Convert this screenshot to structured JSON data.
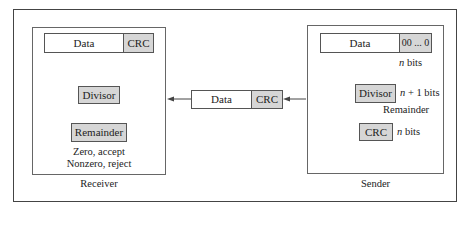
{
  "receiver": {
    "label": "Receiver",
    "codeword": {
      "data": "Data",
      "crc": "CRC"
    },
    "divisor": "Divisor",
    "remainder": "Remainder",
    "result_lines": [
      "Zero, accept",
      "Nonzero, reject"
    ]
  },
  "channel": {
    "data": "Data",
    "crc": "CRC",
    "direction": "sender-to-receiver"
  },
  "sender": {
    "label": "Sender",
    "dataword": {
      "data": "Data",
      "padding": "00 ... 0"
    },
    "padding_note": {
      "var": "n",
      "text": " bits"
    },
    "divisor": "Divisor",
    "divisor_note": {
      "var": "n",
      "text": " + 1 bits"
    },
    "remainder_label": "Remainder",
    "crc": "CRC",
    "crc_note": {
      "var": "n",
      "text": " bits"
    }
  },
  "colors": {
    "box_fill": "#d6d6d6",
    "arrow_fill": "#2a2a2a",
    "border": "#444444"
  }
}
